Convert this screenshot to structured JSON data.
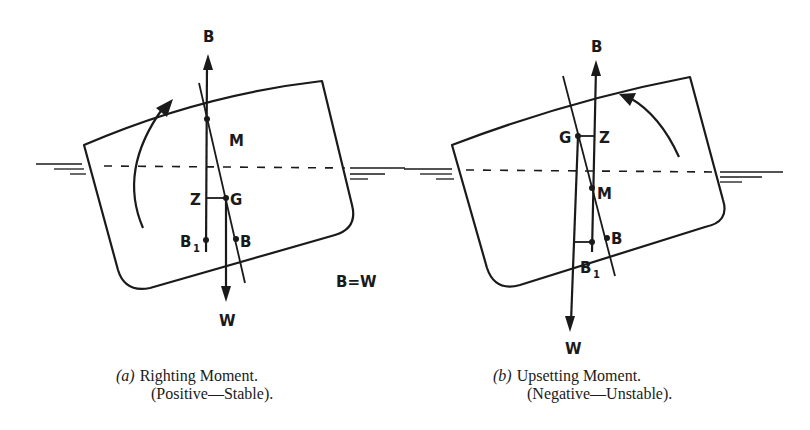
{
  "figure": {
    "panel_a": {
      "labels": {
        "buoyancy_top": "B",
        "metacenter": "M",
        "z_point": "Z",
        "gravity": "G",
        "b1_main": "B",
        "b1_sub": "1",
        "buoyancy_center": "B",
        "weight": "W",
        "equality": "B=W"
      },
      "caption": {
        "letter": "(a)",
        "line1": "Righting Moment.",
        "line2": "(Positive—Stable)."
      },
      "rotation_direction": "clockwise-arrow-icon"
    },
    "panel_b": {
      "labels": {
        "buoyancy_top": "B",
        "gravity": "G",
        "z_point": "Z",
        "metacenter": "M",
        "buoyancy_center": "B",
        "b1_main": "B",
        "b1_sub": "1",
        "weight": "W"
      },
      "caption": {
        "letter": "(b)",
        "line1": "Upsetting Moment.",
        "line2": "(Negative—Unstable)."
      },
      "rotation_direction": "counterclockwise-arrow-icon"
    },
    "colors": {
      "ink": "#1a1a1a",
      "background": "#ffffff"
    }
  }
}
